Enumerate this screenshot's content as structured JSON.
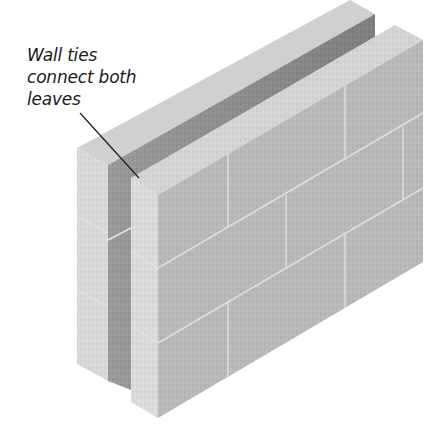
{
  "figure": {
    "annotation": {
      "lines": [
        "Wall ties",
        "connect both",
        "leaves"
      ]
    },
    "colors": {
      "background": "#ffffff",
      "front_face": "#b9b9b9",
      "top_face": "#d3d3d3",
      "end_face": "#dcdcdc",
      "cavity_shadow": "#8a8a8a",
      "mortar": "#e2e2e2",
      "leader_line": "#222222",
      "text": "#1a1a1a"
    }
  }
}
